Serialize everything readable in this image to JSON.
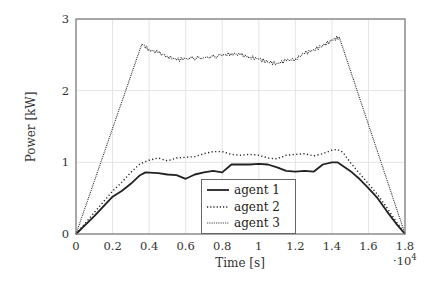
{
  "chart_data": {
    "type": "line",
    "title": "",
    "xlabel": "Time [s]",
    "ylabel": "Power [kW]",
    "x_multiplier": "·10^4",
    "xlim": [
      0,
      1.8
    ],
    "ylim": [
      0,
      3
    ],
    "grid": true,
    "legend_position": "lower center",
    "x_ticks": [
      "0",
      "0.2",
      "0.4",
      "0.6",
      "0.8",
      "1",
      "1.2",
      "1.4",
      "1.6",
      "1.8"
    ],
    "y_ticks": [
      "0",
      "1",
      "2",
      "3"
    ],
    "series": [
      {
        "name": "agent 1",
        "style": "solid",
        "x": [
          0,
          0.1,
          0.2,
          0.25,
          0.3,
          0.35,
          0.38,
          0.45,
          0.5,
          0.55,
          0.6,
          0.65,
          0.7,
          0.75,
          0.8,
          0.85,
          0.9,
          0.95,
          1.0,
          1.05,
          1.1,
          1.15,
          1.2,
          1.25,
          1.3,
          1.35,
          1.4,
          1.43,
          1.46,
          1.5,
          1.55,
          1.6,
          1.65,
          1.7,
          1.75,
          1.8
        ],
        "values": [
          0,
          0.25,
          0.52,
          0.6,
          0.7,
          0.82,
          0.86,
          0.85,
          0.83,
          0.82,
          0.77,
          0.83,
          0.86,
          0.88,
          0.86,
          0.97,
          0.97,
          0.97,
          0.98,
          0.97,
          0.93,
          0.88,
          0.87,
          0.88,
          0.87,
          0.97,
          1.0,
          1.0,
          0.95,
          0.88,
          0.77,
          0.64,
          0.5,
          0.32,
          0.15,
          0
        ]
      },
      {
        "name": "agent 2",
        "style": "dotted",
        "x": [
          0,
          0.1,
          0.2,
          0.25,
          0.3,
          0.35,
          0.4,
          0.45,
          0.5,
          0.55,
          0.6,
          0.65,
          0.7,
          0.75,
          0.8,
          0.85,
          0.9,
          0.95,
          1.0,
          1.05,
          1.1,
          1.15,
          1.2,
          1.25,
          1.3,
          1.35,
          1.4,
          1.43,
          1.46,
          1.5,
          1.55,
          1.6,
          1.65,
          1.7,
          1.75,
          1.8
        ],
        "values": [
          0,
          0.3,
          0.6,
          0.72,
          0.86,
          0.98,
          1.03,
          1.06,
          1.02,
          1.06,
          1.07,
          1.08,
          1.12,
          1.15,
          1.15,
          1.11,
          1.1,
          1.11,
          1.1,
          1.06,
          1.05,
          1.1,
          1.11,
          1.12,
          1.09,
          1.12,
          1.17,
          1.18,
          1.14,
          1.0,
          0.85,
          0.7,
          0.55,
          0.37,
          0.18,
          0
        ]
      },
      {
        "name": "agent 3",
        "style": "dense-dotted",
        "x": [
          0,
          0.36,
          0.4,
          0.45,
          0.5,
          0.55,
          0.6,
          0.7,
          0.8,
          0.85,
          0.9,
          0.95,
          1.0,
          1.05,
          1.1,
          1.15,
          1.2,
          1.25,
          1.3,
          1.35,
          1.4,
          1.44,
          1.8
        ],
        "values": [
          0,
          2.65,
          2.57,
          2.53,
          2.48,
          2.43,
          2.45,
          2.46,
          2.49,
          2.52,
          2.5,
          2.47,
          2.44,
          2.4,
          2.38,
          2.42,
          2.44,
          2.52,
          2.57,
          2.63,
          2.7,
          2.75,
          0
        ]
      }
    ]
  }
}
